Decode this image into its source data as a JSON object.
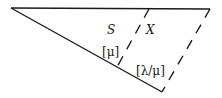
{
  "diagram": {
    "type": "triangle-partition",
    "labels": {
      "region_left": "S",
      "region_right": "X",
      "segment_left": "[μ]",
      "segment_right": "[λ/μ]"
    },
    "colors": {
      "stroke": "#1a1a1a",
      "background": "#ffffff"
    }
  }
}
